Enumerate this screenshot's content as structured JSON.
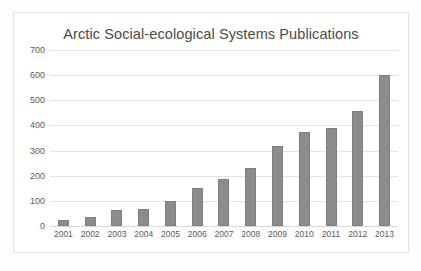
{
  "chart_data": {
    "type": "bar",
    "title": "Arctic Social-ecological Systems Publications",
    "xlabel": "",
    "ylabel": "",
    "categories": [
      "2001",
      "2002",
      "2003",
      "2004",
      "2005",
      "2006",
      "2007",
      "2008",
      "2009",
      "2010",
      "2011",
      "2012",
      "2013"
    ],
    "values": [
      25,
      36,
      62,
      68,
      100,
      152,
      188,
      232,
      318,
      372,
      390,
      458,
      600
    ],
    "ylim": [
      0,
      700
    ],
    "yticks": [
      "0",
      "100",
      "200",
      "300",
      "400",
      "500",
      "600",
      "700"
    ],
    "ytick_values": [
      0,
      100,
      200,
      300,
      400,
      500,
      600,
      700
    ],
    "grid": true,
    "legend": "none",
    "series_color": "#8c8c8c",
    "gridline_color": "#e4e4e4",
    "border_color": "#e2e2e2",
    "title_color": "#4a4a4a",
    "tick_color": "#5a5a5a",
    "plot_background": "#ffffff"
  }
}
